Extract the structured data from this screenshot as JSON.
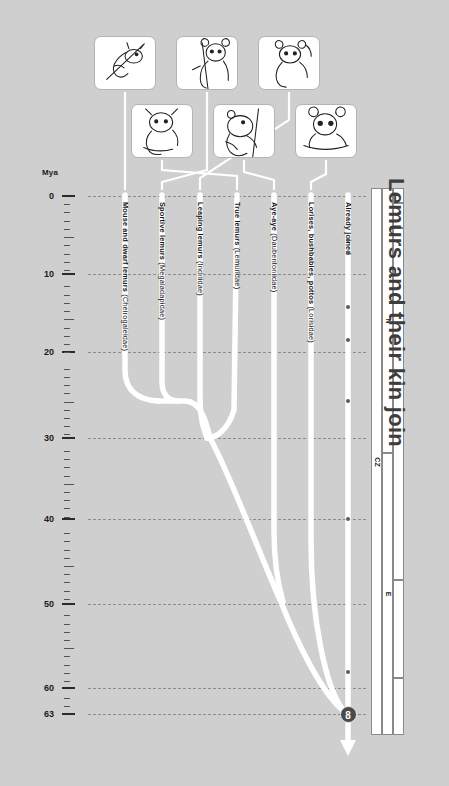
{
  "title": "Lemurs and their kin join",
  "axis": {
    "unit_label": "Mya",
    "ticks": [
      {
        "value": "0",
        "y": 196
      },
      {
        "value": "10",
        "y": 274
      },
      {
        "value": "20",
        "y": 352
      },
      {
        "value": "30",
        "y": 438
      },
      {
        "value": "40",
        "y": 519
      },
      {
        "value": "50",
        "y": 604
      },
      {
        "value": "60",
        "y": 688
      },
      {
        "value": "63",
        "y": 714
      }
    ]
  },
  "clades": [
    {
      "id": "cheirogaleidae",
      "common": "Mouse and dwarf lemurs ",
      "sci": "(Cheirogaleidae)",
      "x": 125,
      "label_y": 202
    },
    {
      "id": "megaladapidae",
      "common": "Sportive lemurs ",
      "sci": "(Megaladapidae)",
      "x": 162,
      "label_y": 202
    },
    {
      "id": "indriidae",
      "common": "Leaping lemurs ",
      "sci": "(Indriidae)",
      "x": 200,
      "label_y": 202
    },
    {
      "id": "lemuridae",
      "common": "True lemurs ",
      "sci": "(Lemuridae)",
      "x": 237,
      "label_y": 202
    },
    {
      "id": "daubentoniidae",
      "common": "Aye-aye ",
      "sci": "(Daubentoniidae)",
      "x": 274,
      "label_y": 202
    },
    {
      "id": "lorisidae",
      "common": "Lorises, bushbabies, pottos ",
      "sci": "(Lorisidae)",
      "x": 311,
      "label_y": 202
    },
    {
      "id": "already-joined",
      "common": "Already joined",
      "sci": "",
      "x": 348,
      "label_y": 202
    }
  ],
  "root_node": {
    "number": "8",
    "age": "63",
    "x": 348,
    "y": 714
  },
  "fossil_dots": [
    {
      "x": 348,
      "y": 240
    },
    {
      "x": 348,
      "y": 253
    },
    {
      "x": 348,
      "y": 307
    },
    {
      "x": 348,
      "y": 340
    },
    {
      "x": 348,
      "y": 401
    },
    {
      "x": 348,
      "y": 519
    },
    {
      "x": 348,
      "y": 672
    }
  ],
  "geo_scale": {
    "era": [
      {
        "label": "CZ",
        "top": 188,
        "bottom": 735
      }
    ],
    "period": [
      {
        "label": "N",
        "top": 188,
        "bottom": 453
      },
      {
        "label": "E",
        "top": 453,
        "bottom": 735
      }
    ],
    "epoch": [
      {
        "label": "",
        "top": 188,
        "bottom": 203
      },
      {
        "label": "",
        "top": 203,
        "bottom": 228
      },
      {
        "label": "",
        "top": 228,
        "bottom": 384
      },
      {
        "label": "",
        "top": 384,
        "bottom": 580
      },
      {
        "label": "",
        "top": 580,
        "bottom": 678
      },
      {
        "label": "",
        "top": 678,
        "bottom": 735
      }
    ]
  },
  "thumbnails": [
    {
      "id": "thumb-cheirogaleidae",
      "name": "mouse-lemur-illustration",
      "x": 94,
      "y": 36,
      "w": 62,
      "h": 54
    },
    {
      "id": "thumb-megaladapidae",
      "name": "sportive-lemur-illustration",
      "x": 176,
      "y": 36,
      "w": 62,
      "h": 54
    },
    {
      "id": "thumb-indriidae",
      "name": "indri-illustration",
      "x": 258,
      "y": 36,
      "w": 62,
      "h": 54
    },
    {
      "id": "thumb-lemuridae",
      "name": "true-lemur-illustration",
      "x": 131,
      "y": 104,
      "w": 62,
      "h": 54
    },
    {
      "id": "thumb-daubentoniidae",
      "name": "aye-aye-illustration",
      "x": 213,
      "y": 104,
      "w": 62,
      "h": 54
    },
    {
      "id": "thumb-lorisidae",
      "name": "loris-illustration",
      "x": 295,
      "y": 104,
      "w": 62,
      "h": 54
    }
  ],
  "colors": {
    "background": "#cfcfcf",
    "branch": "#ffffff",
    "gridline": "#8c8c8c",
    "node": "#4a4a4a",
    "title": "#3d3d3d"
  }
}
